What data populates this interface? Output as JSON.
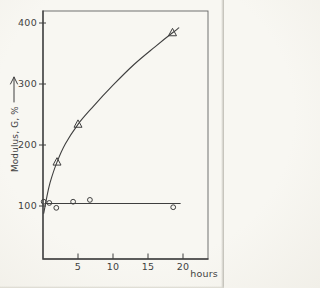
{
  "figure": {
    "kind": "scanned hand-drawn line chart",
    "ink_color": "#3f3f3f",
    "paper_color": "#f6f5f0"
  },
  "chart_data": {
    "type": "line",
    "title": "",
    "xlabel": "hours",
    "ylabel": "Modulus, G, %",
    "ylabel_arrow": "→",
    "x_ticks": [
      5,
      10,
      15,
      20
    ],
    "y_ticks": [
      100,
      200,
      300,
      400
    ],
    "x_range": [
      0,
      23.5
    ],
    "y_range": [
      15,
      420
    ],
    "grid": false,
    "legend": null,
    "series": [
      {
        "name": "modulus-increasing",
        "marker": "open-triangle",
        "points": [
          {
            "x": 2,
            "y": 172
          },
          {
            "x": 5,
            "y": 234
          },
          {
            "x": 18.5,
            "y": 384
          }
        ],
        "curve": [
          [
            0.1,
            88
          ],
          [
            0.5,
            112
          ],
          [
            1,
            138
          ],
          [
            2,
            172
          ],
          [
            3.2,
            202
          ],
          [
            5,
            234
          ],
          [
            7,
            261
          ],
          [
            10,
            298
          ],
          [
            13,
            332
          ],
          [
            16,
            361
          ],
          [
            18.5,
            384
          ],
          [
            19.4,
            392
          ]
        ]
      },
      {
        "name": "modulus-constant",
        "marker": "open-circle",
        "points": [
          {
            "x": 0.1,
            "y": 107
          },
          {
            "x": 0.9,
            "y": 105
          },
          {
            "x": 1.9,
            "y": 97
          },
          {
            "x": 4.3,
            "y": 107
          },
          {
            "x": 6.7,
            "y": 110
          },
          {
            "x": 18.6,
            "y": 98
          }
        ],
        "line": {
          "x1": 0.4,
          "x2": 19.6,
          "y": 104
        }
      }
    ]
  }
}
